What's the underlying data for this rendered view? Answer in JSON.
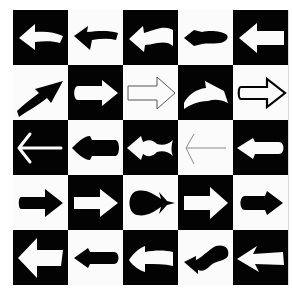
{
  "grid": {
    "rows": 5,
    "cols": 5,
    "colors": {
      "black": "#030303",
      "white": "#fbfbfb",
      "gray": "#8a8a8a"
    },
    "cells": [
      [
        {
          "bg": "black",
          "dir": "left",
          "style": "curved-block",
          "fill": "white"
        },
        {
          "bg": "white",
          "dir": "left",
          "style": "curved-barbed",
          "fill": "black"
        },
        {
          "bg": "black",
          "dir": "left",
          "style": "curved-wavy",
          "fill": "white"
        },
        {
          "bg": "white",
          "dir": "left",
          "style": "blob",
          "fill": "black"
        },
        {
          "bg": "black",
          "dir": "left",
          "style": "block",
          "fill": "white"
        }
      ],
      [
        {
          "bg": "white",
          "dir": "up-right",
          "style": "curved-swoosh",
          "fill": "black"
        },
        {
          "bg": "black",
          "dir": "right",
          "style": "rounded",
          "fill": "white"
        },
        {
          "bg": "white",
          "dir": "right",
          "style": "outline-thin",
          "fill": "none"
        },
        {
          "bg": "black",
          "dir": "right",
          "style": "curved-arc",
          "fill": "white"
        },
        {
          "bg": "white",
          "dir": "right",
          "style": "outline-thick",
          "fill": "none"
        }
      ],
      [
        {
          "bg": "black",
          "dir": "left",
          "style": "thin-line",
          "fill": "white"
        },
        {
          "bg": "white",
          "dir": "left",
          "style": "bullet",
          "fill": "black"
        },
        {
          "bg": "black",
          "dir": "left",
          "style": "fish",
          "fill": "white"
        },
        {
          "bg": "white",
          "dir": "left",
          "style": "thin-line",
          "fill": "gray"
        },
        {
          "bg": "black",
          "dir": "left",
          "style": "rounded-tail",
          "fill": "white"
        }
      ],
      [
        {
          "bg": "white",
          "dir": "right",
          "style": "block",
          "fill": "black"
        },
        {
          "bg": "black",
          "dir": "right",
          "style": "block",
          "fill": "white"
        },
        {
          "bg": "white",
          "dir": "right",
          "style": "teardrop",
          "fill": "black"
        },
        {
          "bg": "black",
          "dir": "right",
          "style": "block",
          "fill": "white"
        },
        {
          "bg": "white",
          "dir": "right",
          "style": "rounded-tail",
          "fill": "black"
        }
      ],
      [
        {
          "bg": "black",
          "dir": "left",
          "style": "wide-block",
          "fill": "white"
        },
        {
          "bg": "white",
          "dir": "left",
          "style": "rounded-tail",
          "fill": "black"
        },
        {
          "bg": "black",
          "dir": "left",
          "style": "curved-block",
          "fill": "white"
        },
        {
          "bg": "white",
          "dir": "left",
          "style": "wavy",
          "fill": "black"
        },
        {
          "bg": "black",
          "dir": "left",
          "style": "feather",
          "fill": "white"
        }
      ]
    ]
  }
}
